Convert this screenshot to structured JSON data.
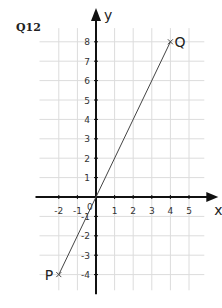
{
  "question_label": "Q12",
  "chart_data": {
    "type": "line",
    "title": "",
    "xlabel": "x",
    "ylabel": "y",
    "xlim": [
      -2.5,
      5.5
    ],
    "ylim": [
      -4.5,
      8.5
    ],
    "grid": true,
    "x_ticks": [
      "-2",
      "-1",
      "0",
      "1",
      "2",
      "3",
      "4",
      "5"
    ],
    "y_ticks": [
      "-4",
      "-3",
      "-2",
      "-1",
      "1",
      "2",
      "3",
      "4",
      "5",
      "6",
      "7",
      "8"
    ],
    "origin_label": "0",
    "series": [
      {
        "name": "PQ",
        "points": [
          {
            "label": "P",
            "x": -2,
            "y": -4
          },
          {
            "label": "Q",
            "x": 4,
            "y": 8
          }
        ]
      }
    ],
    "colors": {
      "axis": "#111111",
      "grid": "#dcdcdc",
      "line": "#444444",
      "text": "#222222"
    }
  }
}
